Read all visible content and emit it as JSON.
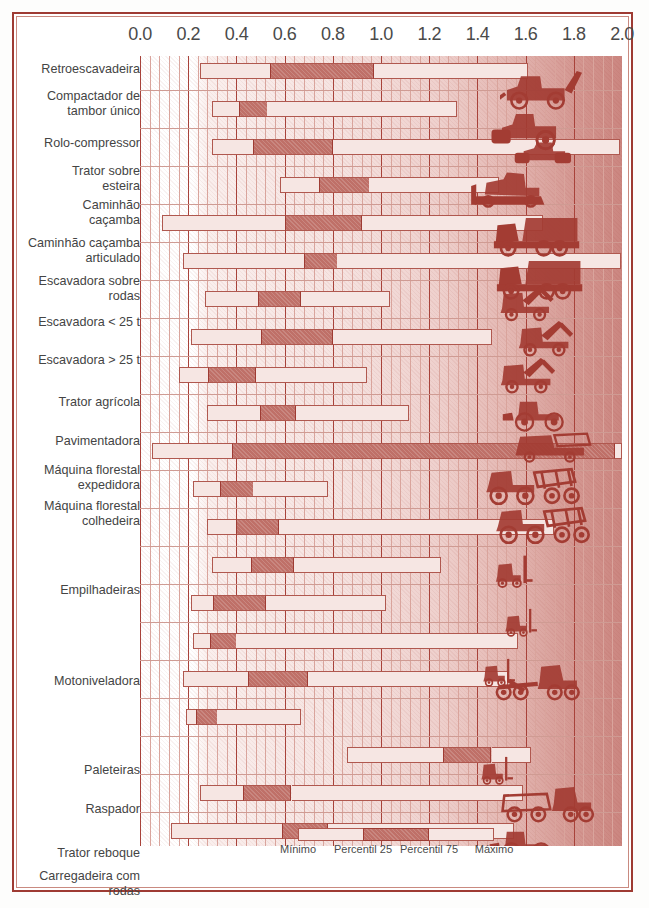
{
  "chart_data": {
    "type": "bar",
    "subtype": "range-min-p25-p75-max",
    "title": "",
    "xlabel": "",
    "ylabel": "",
    "xlim": [
      0.0,
      2.0
    ],
    "grid": true,
    "legend_position": "bottom",
    "axis": {
      "ticks": [
        0.0,
        0.2,
        0.4,
        0.6,
        0.8,
        1.0,
        1.2,
        1.4,
        1.6,
        1.8,
        2.0
      ],
      "tick_labels": [
        "0.0",
        "0.2",
        "0.4",
        "0.6",
        "0.8",
        "1.0",
        "1.2",
        "1.4",
        "1.6",
        "1.8",
        "2.0"
      ],
      "minor_tick_step": 0.04
    },
    "series": [
      {
        "name": "Mínimo",
        "color": "#f6e6e3"
      },
      {
        "name": "Percentil 25",
        "color": "#bf7068"
      },
      {
        "name": "Percentil 75",
        "color": "#bf7068"
      },
      {
        "name": "Máximo",
        "color": "#f6e6e3"
      }
    ],
    "categories": [
      "Retroescavadeira",
      "Compactador de\ntambor único",
      "Rolo-compressor",
      "Trator sobre\nesteira",
      "Caminhão\ncaçamba",
      "Caminhão caçamba\narticulado",
      "Escavadora sobre\nrodas",
      "Escavadora < 25 t",
      "Escavadora > 25 t",
      "Trator agrícola",
      "Pavimentadora",
      "Máquina florestal\nexpedidora",
      "Máquina florestal\ncolhedeira",
      "Empilhadeiras",
      "Motoniveladora",
      "Paleteiras",
      "Raspador",
      "Trator reboque",
      "Carregadeira com\nrodas"
    ],
    "rows": [
      {
        "label": "Retroescavadeira",
        "min": 0.25,
        "p25": 0.54,
        "p75": 0.97,
        "max": 1.61
      },
      {
        "label": "Compactador de tambor único",
        "min": 0.3,
        "p25": 0.41,
        "p75": 0.53,
        "max": 1.32
      },
      {
        "label": "Rolo-compressor",
        "min": 0.3,
        "p25": 0.47,
        "p75": 0.8,
        "max": 1.99
      },
      {
        "label": "Trator sobre esteira",
        "min": 0.58,
        "p25": 0.74,
        "p75": 0.95,
        "max": 1.49
      },
      {
        "label": "Caminhão caçamba",
        "min": 0.09,
        "p25": 0.6,
        "p75": 0.92,
        "max": 1.67
      },
      {
        "label": "Caminhão caçamba articulado",
        "min": 0.18,
        "p25": 0.68,
        "p75": 0.82,
        "max": 2.0
      },
      {
        "label": "Escavadora sobre rodas",
        "min": 0.27,
        "p25": 0.49,
        "p75": 0.67,
        "max": 1.04
      },
      {
        "label": "Escavadora < 25 t",
        "min": 0.21,
        "p25": 0.5,
        "p75": 0.8,
        "max": 1.46
      },
      {
        "label": "Escavadora > 25 t",
        "min": 0.16,
        "p25": 0.28,
        "p75": 0.48,
        "max": 0.94
      },
      {
        "label": "Trator agrícola",
        "min": 0.28,
        "p25": 0.5,
        "p75": 0.65,
        "max": 1.12
      },
      {
        "label": "Pavimentadora",
        "min": 0.05,
        "p25": 0.38,
        "p75": 1.97,
        "max": 2.0
      },
      {
        "label": "Máquina florestal expedidora",
        "min": 0.22,
        "p25": 0.33,
        "p75": 0.47,
        "max": 0.78
      },
      {
        "label": "Máquina florestal colhedeira",
        "min": 0.28,
        "p25": 0.4,
        "p75": 0.58,
        "max": 1.72
      },
      {
        "label": "Empilhadeiras",
        "min": 0.3,
        "p25": 0.46,
        "p75": 0.64,
        "max": 1.25
      },
      {
        "label": "Empilhadeiras-2",
        "min": 0.21,
        "p25": 0.3,
        "p75": 0.52,
        "max": 1.02
      },
      {
        "label": "Motoniveladora",
        "min": 0.22,
        "p25": 0.29,
        "p75": 0.4,
        "max": 1.57
      },
      {
        "label": "Motoniveladora-2",
        "min": 0.18,
        "p25": 0.45,
        "p75": 0.7,
        "max": 1.53
      },
      {
        "label": "Paleteiras",
        "min": 0.19,
        "p25": 0.23,
        "p75": 0.32,
        "max": 0.67
      },
      {
        "label": "Raspador",
        "min": 0.86,
        "p25": 1.26,
        "p75": 1.46,
        "max": 1.62
      },
      {
        "label": "Trator reboque",
        "min": 0.25,
        "p25": 0.43,
        "p75": 0.63,
        "max": 1.59
      },
      {
        "label": "Carregadeira com rodas",
        "min": 0.13,
        "p25": 0.59,
        "p75": 0.78,
        "max": 1.55
      }
    ]
  },
  "labels": {
    "entries": [
      {
        "text": "Retroescavadeira",
        "top": 6
      },
      {
        "text": "Compactador de\ntambor único",
        "top": 33
      },
      {
        "text": "Rolo-compressor",
        "top": 80
      },
      {
        "text": "Trator sobre\nesteira",
        "top": 108
      },
      {
        "text": "Caminhão\ncaçamba",
        "top": 142
      },
      {
        "text": "Caminhão caçamba\narticulado",
        "top": 180
      },
      {
        "text": "Escavadora sobre\nrodas",
        "top": 218
      },
      {
        "text": "Escavadora < 25 t",
        "top": 259
      },
      {
        "text": "Escavadora > 25 t",
        "top": 297
      },
      {
        "text": "Trator agrícola",
        "top": 339
      },
      {
        "text": "Pavimentadora",
        "top": 378
      },
      {
        "text": "Máquina florestal\nexpedidora",
        "top": 407
      },
      {
        "text": "Máquina florestal\ncolhedeira",
        "top": 443
      },
      {
        "text": "Empilhadeiras",
        "top": 527
      },
      {
        "text": "Motoniveladora",
        "top": 618
      },
      {
        "text": "Paleteiras",
        "top": 707
      },
      {
        "text": "Raspador",
        "top": 746
      },
      {
        "text": "Trator reboque",
        "top": 790
      },
      {
        "text": "Carregadeira com\nrodas",
        "top": 813
      }
    ]
  },
  "legend": {
    "items": [
      {
        "label": "Mínimo",
        "center": 298
      },
      {
        "label": "Percentil 25",
        "center": 363
      },
      {
        "label": "Percentil 75",
        "center": 429
      },
      {
        "label": "Máximo",
        "center": 494
      }
    ]
  },
  "colors": {
    "frame": "#9e3b33",
    "grid_major": "#a8423a",
    "grid_minor": "#d9a49c",
    "bar_light": "#f6e6e3",
    "bar_dark": "#bf7068",
    "text": "#444444",
    "icon": "#a33c33"
  },
  "machines": [
    {
      "name": "backhoe-loader-icon",
      "x": 360,
      "y": 2,
      "w": 96,
      "h": 52
    },
    {
      "name": "single-drum-compactor-icon",
      "x": 348,
      "y": 46,
      "w": 96,
      "h": 50
    },
    {
      "name": "road-roller-icon",
      "x": 372,
      "y": 82,
      "w": 84,
      "h": 40
    },
    {
      "name": "crawler-tractor-icon",
      "x": 330,
      "y": 113,
      "w": 96,
      "h": 46
    },
    {
      "name": "dump-truck-icon",
      "x": 350,
      "y": 155,
      "w": 102,
      "h": 48
    },
    {
      "name": "articulated-dump-icon",
      "x": 352,
      "y": 198,
      "w": 104,
      "h": 48
    },
    {
      "name": "wheeled-excavator-icon",
      "x": 348,
      "y": 228,
      "w": 86,
      "h": 44
    },
    {
      "name": "mini-excavator-icon",
      "x": 366,
      "y": 263,
      "w": 88,
      "h": 44
    },
    {
      "name": "large-excavator-icon",
      "x": 348,
      "y": 300,
      "w": 88,
      "h": 44
    },
    {
      "name": "farm-tractor-icon",
      "x": 358,
      "y": 338,
      "w": 92,
      "h": 42
    },
    {
      "name": "paver-icon",
      "x": 358,
      "y": 373,
      "w": 108,
      "h": 42
    },
    {
      "name": "forwarder-icon",
      "x": 330,
      "y": 406,
      "w": 116,
      "h": 48
    },
    {
      "name": "harvester-icon",
      "x": 340,
      "y": 445,
      "w": 116,
      "h": 48
    },
    {
      "name": "forklift-reach-icon",
      "x": 352,
      "y": 490,
      "w": 72,
      "h": 52
    },
    {
      "name": "forklift-icon",
      "x": 362,
      "y": 540,
      "w": 62,
      "h": 54
    },
    {
      "name": "pallet-stacker-icon",
      "x": 340,
      "y": 590,
      "w": 62,
      "h": 54
    },
    {
      "name": "motor-grader-icon",
      "x": 350,
      "y": 604,
      "w": 104,
      "h": 46
    },
    {
      "name": "pallet-jack-icon",
      "x": 338,
      "y": 690,
      "w": 62,
      "h": 50
    },
    {
      "name": "scraper-icon",
      "x": 348,
      "y": 726,
      "w": 116,
      "h": 46
    },
    {
      "name": "tow-tractor-icon",
      "x": 348,
      "y": 766,
      "w": 86,
      "h": 46
    },
    {
      "name": "wheel-loader-icon",
      "x": 350,
      "y": 800,
      "w": 92,
      "h": 46
    }
  ]
}
